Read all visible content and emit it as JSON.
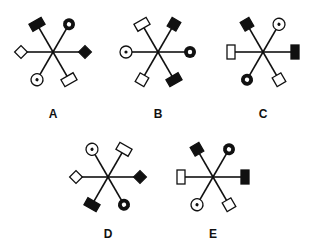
{
  "figures": [
    {
      "label": "A",
      "x": 3,
      "y": 0,
      "cx": 50,
      "cy": 52,
      "label_y": 107,
      "arms": [
        {
          "angle": -120,
          "shape": "rect",
          "fill": "black"
        },
        {
          "angle": -60,
          "shape": "ring",
          "fill": "black"
        },
        {
          "angle": 0,
          "shape": "diamond",
          "fill": "black"
        },
        {
          "angle": 60,
          "shape": "rect",
          "fill": "white"
        },
        {
          "angle": 120,
          "shape": "dotcircle",
          "fill": "white"
        },
        {
          "angle": 180,
          "shape": "diamond",
          "fill": "white"
        }
      ]
    },
    {
      "label": "B",
      "x": 108,
      "y": 0,
      "cx": 50,
      "cy": 52,
      "label_y": 107,
      "arms": [
        {
          "angle": -120,
          "shape": "rect",
          "fill": "white"
        },
        {
          "angle": -60,
          "shape": "square",
          "fill": "black"
        },
        {
          "angle": 0,
          "shape": "ring",
          "fill": "black"
        },
        {
          "angle": 60,
          "shape": "rect",
          "fill": "black"
        },
        {
          "angle": 120,
          "shape": "square",
          "fill": "white"
        },
        {
          "angle": 180,
          "shape": "dotcircle",
          "fill": "white"
        }
      ]
    },
    {
      "label": "C",
      "x": 213,
      "y": 0,
      "cx": 50,
      "cy": 52,
      "label_y": 107,
      "arms": [
        {
          "angle": -120,
          "shape": "square",
          "fill": "black"
        },
        {
          "angle": -60,
          "shape": "dotcircle",
          "fill": "white"
        },
        {
          "angle": 0,
          "shape": "vrect",
          "fill": "black"
        },
        {
          "angle": 60,
          "shape": "square",
          "fill": "white"
        },
        {
          "angle": 120,
          "shape": "ring",
          "fill": "black"
        },
        {
          "angle": 180,
          "shape": "vrect",
          "fill": "white"
        }
      ]
    },
    {
      "label": "D",
      "x": 58,
      "y": 125,
      "cx": 50,
      "cy": 52,
      "label_y": 102,
      "arms": [
        {
          "angle": -120,
          "shape": "dotcircle",
          "fill": "white"
        },
        {
          "angle": -60,
          "shape": "rect",
          "fill": "white"
        },
        {
          "angle": 0,
          "shape": "diamond",
          "fill": "black"
        },
        {
          "angle": 60,
          "shape": "ring",
          "fill": "black"
        },
        {
          "angle": 120,
          "shape": "rect",
          "fill": "black"
        },
        {
          "angle": 180,
          "shape": "diamond",
          "fill": "white"
        }
      ]
    },
    {
      "label": "E",
      "x": 163,
      "y": 125,
      "cx": 50,
      "cy": 52,
      "label_y": 102,
      "arms": [
        {
          "angle": -120,
          "shape": "square",
          "fill": "black"
        },
        {
          "angle": -60,
          "shape": "ring",
          "fill": "black"
        },
        {
          "angle": 0,
          "shape": "vrect",
          "fill": "black"
        },
        {
          "angle": 60,
          "shape": "square",
          "fill": "white"
        },
        {
          "angle": 120,
          "shape": "dotcircle",
          "fill": "white"
        },
        {
          "angle": 180,
          "shape": "vrect",
          "fill": "white"
        }
      ]
    }
  ]
}
